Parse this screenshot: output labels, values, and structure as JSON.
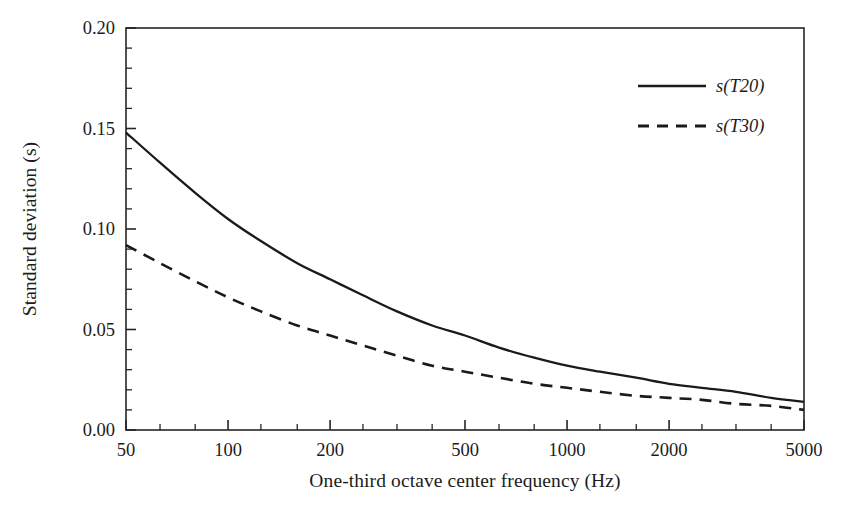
{
  "chart_data": {
    "type": "line",
    "title": "",
    "subtitle": "",
    "xlabel": "One-third octave center frequency (Hz)",
    "ylabel": "Standard deviation (s)",
    "xscale": "log",
    "yscale": "linear",
    "xlim": [
      50,
      5000
    ],
    "ylim": [
      0.0,
      0.2
    ],
    "grid": false,
    "legend_position": "top-right",
    "x_tick_labels": [
      "50",
      "100",
      "200",
      "500",
      "1000",
      "2000",
      "5000"
    ],
    "x_tick_values": [
      50,
      100,
      200,
      500,
      1000,
      2000,
      5000
    ],
    "x_minor_ticks_note": "one-third octave center frequencies",
    "x_minor_tick_values": [
      50,
      63,
      80,
      100,
      125,
      160,
      200,
      250,
      315,
      400,
      500,
      630,
      800,
      1000,
      1250,
      1600,
      2000,
      2500,
      3150,
      4000,
      5000
    ],
    "y_tick_labels": [
      "0.00",
      "0.05",
      "0.10",
      "0.15",
      "0.20"
    ],
    "y_tick_values": [
      0.0,
      0.05,
      0.1,
      0.15,
      0.2
    ],
    "y_minor_tick_step": 0.01,
    "series": [
      {
        "name": "s(T20)",
        "style": "solid",
        "color": "#1a1a1a",
        "x": [
          50,
          63,
          80,
          100,
          125,
          160,
          200,
          250,
          315,
          400,
          500,
          630,
          800,
          1000,
          1250,
          1600,
          2000,
          2500,
          3150,
          4000,
          5000
        ],
        "values": [
          0.148,
          0.133,
          0.118,
          0.105,
          0.094,
          0.083,
          0.075,
          0.067,
          0.059,
          0.052,
          0.047,
          0.041,
          0.036,
          0.032,
          0.029,
          0.026,
          0.023,
          0.021,
          0.019,
          0.016,
          0.014
        ]
      },
      {
        "name": "s(T30)",
        "style": "dashed",
        "color": "#1a1a1a",
        "x": [
          50,
          63,
          80,
          100,
          125,
          160,
          200,
          250,
          315,
          400,
          500,
          630,
          800,
          1000,
          1250,
          1600,
          2000,
          2500,
          3150,
          4000,
          5000
        ],
        "values": [
          0.092,
          0.083,
          0.074,
          0.066,
          0.059,
          0.052,
          0.047,
          0.042,
          0.037,
          0.032,
          0.029,
          0.026,
          0.023,
          0.021,
          0.019,
          0.017,
          0.016,
          0.015,
          0.013,
          0.012,
          0.01
        ]
      }
    ],
    "legend": [
      {
        "label": "s(T20)",
        "style": "solid"
      },
      {
        "label": "s(T30)",
        "style": "dashed"
      }
    ]
  },
  "axes": {
    "frame_color": "#262626",
    "background": "#ffffff"
  }
}
